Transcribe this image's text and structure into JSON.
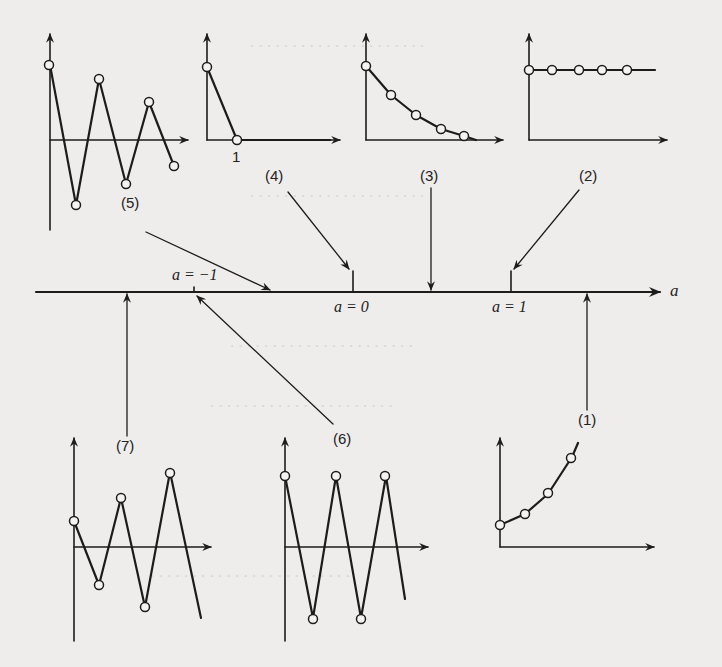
{
  "figure": {
    "axis": {
      "name": "a"
    },
    "markers": [
      {
        "id": "a_minus_1",
        "label": "a = −1"
      },
      {
        "id": "a_zero",
        "label": "a = 0"
      },
      {
        "id": "a_one",
        "label": "a = 1"
      }
    ],
    "panels": [
      {
        "id": "1",
        "label": "(1)",
        "region": "a > 1",
        "behavior": "monotonic explosive growth"
      },
      {
        "id": "2",
        "label": "(2)",
        "region": "a = 1",
        "behavior": "constant"
      },
      {
        "id": "3",
        "label": "(3)",
        "region": "0 < a < 1",
        "behavior": "monotonic decay to zero"
      },
      {
        "id": "4",
        "label": "(4)",
        "region": "a = 0",
        "behavior": "drops to zero after first period",
        "tick_label": "1"
      },
      {
        "id": "5",
        "label": "(5)",
        "region": "−1 < a < 0",
        "behavior": "damped oscillation"
      },
      {
        "id": "6",
        "label": "(6)",
        "region": "a = −1",
        "behavior": "constant-amplitude oscillation"
      },
      {
        "id": "7",
        "label": "(7)",
        "region": "a < −1",
        "behavior": "explosive oscillation"
      }
    ]
  }
}
